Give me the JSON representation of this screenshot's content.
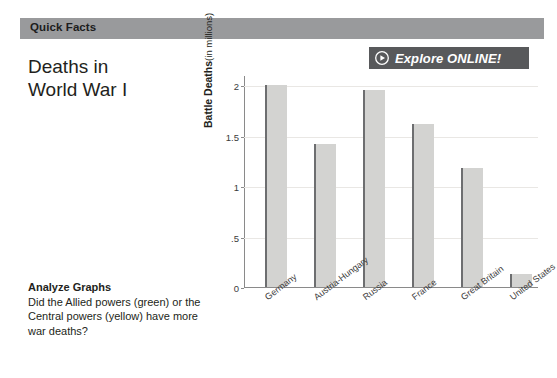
{
  "header": {
    "band_label": "Quick Facts"
  },
  "explore": {
    "label": "Explore ONLINE!",
    "icon": "play-circle-icon",
    "bg_color": "#58595b"
  },
  "analyze": {
    "heading": "Analyze Graphs",
    "question": "Did the Allied powers (green) or the Central powers (yellow) have more war deaths?"
  },
  "chart_data": {
    "type": "bar",
    "xlabel": "",
    "ylabel": "Battle Deaths (in millions)",
    "ylabel_bold_part": "Battle Deaths",
    "ylabel_unit_part": "(in millions)",
    "categories": [
      "Germany",
      "Austria-Hungary",
      "Russia",
      "France",
      "Great Britain",
      "United States"
    ],
    "values": [
      2.0,
      1.42,
      1.95,
      1.61,
      1.18,
      0.13
    ],
    "ylim": [
      0,
      2.1
    ],
    "yticks": [
      0,
      0.5,
      1,
      1.5,
      2
    ],
    "ytick_labels": [
      "0",
      ".5",
      "1",
      "1.5",
      "2"
    ],
    "grid": true,
    "legend": false,
    "bar_color": "#d3d3d1",
    "bar_edge_color": "#6d6e70"
  }
}
